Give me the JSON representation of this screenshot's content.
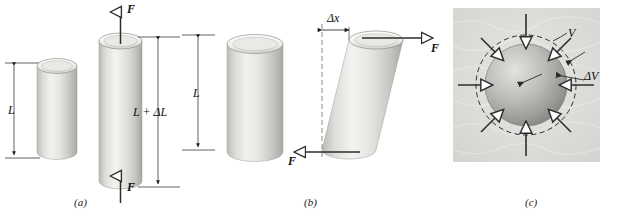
{
  "figure": {
    "panels": [
      {
        "id": "a",
        "caption": "(a)",
        "type": "tensile-stress",
        "labels": {
          "original_length": "L",
          "stretched_length": "L + ΔL",
          "reference_length": "L",
          "force_top": "F",
          "force_bottom": "F"
        },
        "icons": [
          "up-arrow-icon",
          "down-arrow-icon",
          "cylinder-icon",
          "dimension-line-icon"
        ]
      },
      {
        "id": "b",
        "caption": "(b)",
        "type": "shearing-stress",
        "labels": {
          "original_length": "L",
          "shear_offset": "Δx",
          "force_top": "F",
          "force_bottom": "F"
        },
        "icons": [
          "right-arrow-icon",
          "left-arrow-icon",
          "cylinder-icon",
          "sheared-cylinder-icon",
          "dashed-line-icon"
        ]
      },
      {
        "id": "c",
        "caption": "(c)",
        "type": "hydraulic-stress",
        "labels": {
          "volume": "V",
          "volume_change": "ΔV"
        },
        "icons": [
          "sphere-icon",
          "dashed-circle-icon",
          "inward-pressure-arrow-icon"
        ]
      }
    ]
  },
  "colors": {
    "ink": "#111111",
    "cylinder_light": "#f2f2f0",
    "cylinder_mid": "#d9d9d6",
    "cylinder_dark": "#b8b8b4",
    "sphere_light": "#cfcfcc",
    "sphere_dark": "#8e8e8a",
    "panel_c_background": "#dcdcd9",
    "arrow": "#3a3a3a"
  }
}
